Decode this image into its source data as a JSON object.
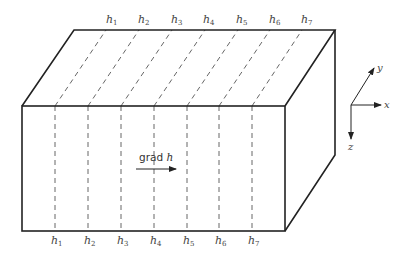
{
  "figure": {
    "type": "3d-block-equipotential-diagram",
    "top_labels": [
      {
        "base": "h",
        "sub": "1"
      },
      {
        "base": "h",
        "sub": "2"
      },
      {
        "base": "h",
        "sub": "3"
      },
      {
        "base": "h",
        "sub": "4"
      },
      {
        "base": "h",
        "sub": "5"
      },
      {
        "base": "h",
        "sub": "6"
      },
      {
        "base": "h",
        "sub": "7"
      }
    ],
    "bottom_labels": [
      {
        "base": "h",
        "sub": "1"
      },
      {
        "base": "h",
        "sub": "2"
      },
      {
        "base": "h",
        "sub": "3"
      },
      {
        "base": "h",
        "sub": "4"
      },
      {
        "base": "h",
        "sub": "5"
      },
      {
        "base": "h",
        "sub": "6"
      },
      {
        "base": "h",
        "sub": "7"
      }
    ],
    "gradient": {
      "word": "grad",
      "var": "h"
    },
    "axes": {
      "x": "x",
      "y": "y",
      "z": "z"
    },
    "colors": {
      "stroke": "#222222",
      "dash": "#555555",
      "text": "#444444"
    }
  }
}
